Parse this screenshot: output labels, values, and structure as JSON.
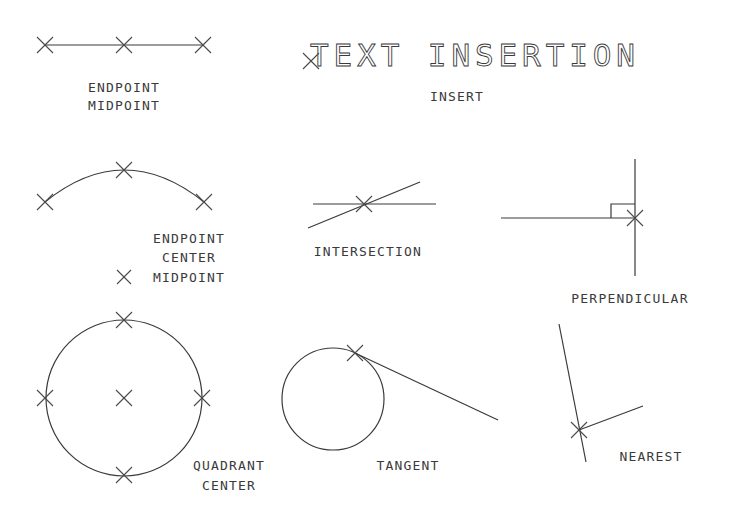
{
  "diagram": {
    "stroke_color": "#3a3a3a",
    "background": "#ffffff",
    "panels": {
      "line": {
        "labels": [
          "ENDPOINT",
          "MIDPOINT"
        ]
      },
      "text": {
        "sample_text": "TEXT INSERTION",
        "labels": [
          "INSERT"
        ]
      },
      "arc": {
        "labels": [
          "ENDPOINT",
          "CENTER",
          "MIDPOINT"
        ]
      },
      "intersection": {
        "labels": [
          "INTERSECTION"
        ]
      },
      "perpendicular": {
        "labels": [
          "PERPENDICULAR"
        ]
      },
      "circle": {
        "labels": [
          "QUADRANT",
          "CENTER"
        ]
      },
      "tangent": {
        "labels": [
          "TANGENT"
        ]
      },
      "nearest": {
        "labels": [
          "NEAREST"
        ]
      }
    },
    "marker_icon": "x-cross-snap-marker"
  }
}
